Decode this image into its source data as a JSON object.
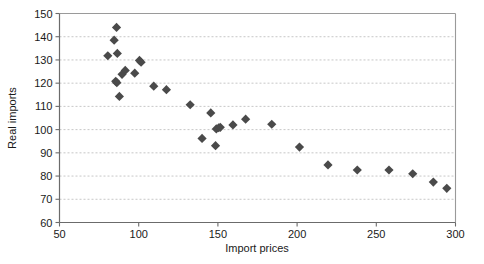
{
  "chart_data": {
    "type": "scatter",
    "title": "",
    "xlabel": "Import prices",
    "ylabel": "Real imports",
    "xlim": [
      50,
      300
    ],
    "ylim": [
      60,
      150
    ],
    "xticks": [
      50,
      100,
      150,
      200,
      250,
      300
    ],
    "yticks": [
      60,
      70,
      80,
      90,
      100,
      110,
      120,
      130,
      140,
      150
    ],
    "grid": "horizontal-dashed",
    "legend": "none",
    "marker": {
      "shape": "diamond",
      "color": "#4a4a4a",
      "size": 4.6
    },
    "series": [
      {
        "name": "Real imports vs Import prices",
        "points": [
          [
            80.5,
            131.8
          ],
          [
            84.5,
            138.5
          ],
          [
            86.0,
            144.0
          ],
          [
            86.5,
            132.8
          ],
          [
            85.5,
            120.8
          ],
          [
            86.2,
            120.2
          ],
          [
            87.8,
            114.3
          ],
          [
            89.5,
            123.8
          ],
          [
            91.5,
            125.5
          ],
          [
            97.5,
            124.3
          ],
          [
            100.5,
            129.8
          ],
          [
            101.5,
            129.0
          ],
          [
            109.5,
            118.7
          ],
          [
            117.5,
            117.2
          ],
          [
            132.5,
            110.7
          ],
          [
            140.0,
            96.2
          ],
          [
            145.5,
            107.2
          ],
          [
            148.5,
            93.1
          ],
          [
            149.0,
            100.3
          ],
          [
            150.5,
            100.8
          ],
          [
            151.5,
            101.0
          ],
          [
            159.5,
            102.0
          ],
          [
            167.5,
            104.5
          ],
          [
            184.0,
            102.3
          ],
          [
            201.5,
            92.5
          ],
          [
            219.5,
            84.8
          ],
          [
            238.0,
            82.6
          ],
          [
            258.0,
            82.6
          ],
          [
            273.0,
            81.0
          ],
          [
            286.0,
            77.4
          ],
          [
            294.5,
            74.7
          ]
        ]
      }
    ]
  },
  "axis": {
    "x_tick_labels": [
      "50",
      "100",
      "150",
      "200",
      "250",
      "300"
    ],
    "y_tick_labels": [
      "60",
      "70",
      "80",
      "90",
      "100",
      "110",
      "120",
      "130",
      "140",
      "150"
    ],
    "x_title": "Import prices",
    "y_title": "Real imports"
  }
}
